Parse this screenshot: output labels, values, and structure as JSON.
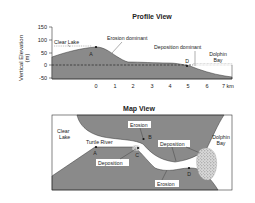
{
  "profile": {
    "title": "Profile View",
    "ylabel_line1": "Vertical Elevation",
    "ylabel_line2": "(m)",
    "y_ticks": [
      "150",
      "100",
      "50",
      "0",
      "-50"
    ],
    "x_ticks": [
      "0",
      "1",
      "2",
      "3",
      "4",
      "5",
      "6",
      "7 km"
    ],
    "labels": {
      "clear_lake": "Clear Lake",
      "erosion": "Erosion dominant",
      "deposition": "Deposition dominant",
      "bay_line1": "Dolphin",
      "bay_line2": "Bay",
      "point_a": "A",
      "point_d": "D"
    }
  },
  "map": {
    "title": "Map View",
    "labels": {
      "clear_lake_line1": "Clear",
      "clear_lake_line2": "Lake",
      "river": "Turtle River",
      "erosion_top": "Erosion",
      "erosion_bottom": "Erosion",
      "deposition_left": "Deposition",
      "deposition_right": "Deposition",
      "bay_line1": "Dolphin",
      "bay_line2": "Bay",
      "point_a": "A",
      "point_b": "B",
      "point_c": "C",
      "point_d": "D"
    }
  },
  "colors": {
    "land": "#8a8a8a",
    "water": "#ffffff",
    "ink": "#222222"
  }
}
